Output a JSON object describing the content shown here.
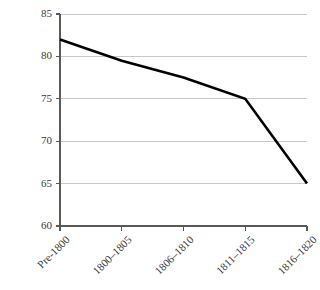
{
  "chart_data": {
    "type": "line",
    "title": "",
    "subtitle": "",
    "xlabel": "",
    "ylabel": "",
    "categories": [
      "Pre-1800",
      "1800–1805",
      "1806–1810",
      "1811–1815",
      "1816–1820"
    ],
    "values": [
      82,
      79.5,
      77.5,
      75,
      65
    ],
    "series": [
      {
        "name": "",
        "values": [
          82,
          79.5,
          77.5,
          75,
          65
        ]
      }
    ],
    "ylim": [
      60,
      85
    ],
    "yticks": [
      60,
      65,
      70,
      75,
      80,
      85
    ],
    "ytick_labels": [
      "60",
      "65",
      "70",
      "75",
      "80",
      "85"
    ],
    "xtick_labels": [
      "Pre-1800",
      "1800–1805",
      "1806–1810",
      "1811–1815",
      "1816–1820"
    ],
    "grid": true,
    "grid_axis": "y",
    "legend": false,
    "legend_position": "none",
    "annotations": []
  },
  "style": {
    "line_color": "#000000",
    "grid_color": "#c8c8c8",
    "axis_color": "#595959",
    "tick_label_color": "#3a3a3a",
    "background_color": "#ffffff"
  },
  "axes": {
    "x_tick_rotation_deg": -45
  }
}
